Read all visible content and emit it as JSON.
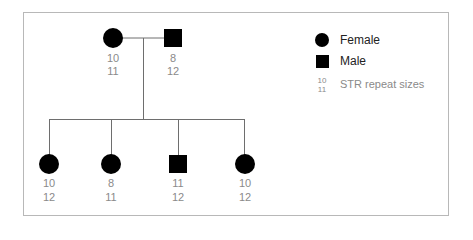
{
  "diagram": {
    "type": "pedigree",
    "parents": [
      {
        "id": "mother",
        "sex": "female",
        "shape": "circle",
        "str": [
          "10",
          "11"
        ]
      },
      {
        "id": "father",
        "sex": "male",
        "shape": "square",
        "str": [
          "8",
          "12"
        ]
      }
    ],
    "children": [
      {
        "id": "child1",
        "sex": "female",
        "shape": "circle",
        "str": [
          "10",
          "12"
        ]
      },
      {
        "id": "child2",
        "sex": "female",
        "shape": "circle",
        "str": [
          "8",
          "11"
        ]
      },
      {
        "id": "child3",
        "sex": "male",
        "shape": "square",
        "str": [
          "11",
          "12"
        ]
      },
      {
        "id": "child4",
        "sex": "female",
        "shape": "circle",
        "str": [
          "10",
          "12"
        ]
      }
    ]
  },
  "legend": {
    "female_label": "Female",
    "male_label": "Male",
    "str_example": [
      "10",
      "11"
    ],
    "str_label": "STR repeat sizes"
  },
  "colors": {
    "symbol": "#000000",
    "line": "#6e6e6e",
    "number_text": "#8a8a8a",
    "frame": "#b8b8b8"
  }
}
